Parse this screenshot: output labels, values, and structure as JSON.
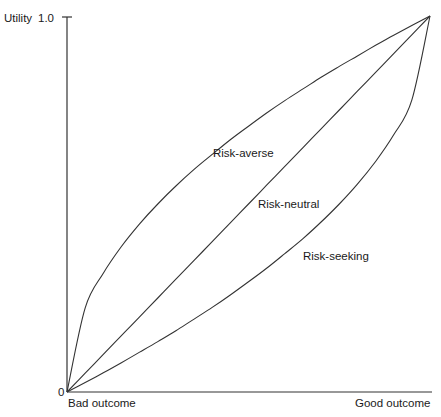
{
  "chart_data": {
    "type": "line",
    "title": "",
    "xlabel": "",
    "ylabel": "Utility",
    "xlim": [
      0,
      1
    ],
    "ylim": [
      0,
      1
    ],
    "x_tick_labels": [
      "Bad outcome",
      "Good outcome"
    ],
    "y_tick_labels": [
      "0",
      "1.0"
    ],
    "grid": false,
    "legend": "none (inline curve labels)",
    "x": [
      0,
      0.05,
      0.1,
      0.15,
      0.2,
      0.25,
      0.3,
      0.35,
      0.4,
      0.45,
      0.5,
      0.55,
      0.6,
      0.65,
      0.7,
      0.75,
      0.8,
      0.85,
      0.9,
      0.95,
      1.0
    ],
    "series": [
      {
        "name": "Risk-averse",
        "values": [
          0,
          0.224,
          0.316,
          0.387,
          0.447,
          0.5,
          0.548,
          0.592,
          0.632,
          0.671,
          0.707,
          0.742,
          0.775,
          0.806,
          0.837,
          0.866,
          0.894,
          0.922,
          0.949,
          0.975,
          1.0
        ]
      },
      {
        "name": "Risk-neutral",
        "values": [
          0,
          0.05,
          0.1,
          0.15,
          0.2,
          0.25,
          0.3,
          0.35,
          0.4,
          0.45,
          0.5,
          0.55,
          0.6,
          0.65,
          0.7,
          0.75,
          0.8,
          0.85,
          0.9,
          0.95,
          1.0
        ]
      },
      {
        "name": "Risk-seeking",
        "values": [
          0,
          0.025,
          0.051,
          0.078,
          0.106,
          0.134,
          0.163,
          0.194,
          0.225,
          0.258,
          0.293,
          0.329,
          0.368,
          0.408,
          0.452,
          0.5,
          0.553,
          0.613,
          0.684,
          0.776,
          1.0
        ]
      }
    ],
    "annotations": [
      {
        "text": "Risk-averse",
        "series": "Risk-averse"
      },
      {
        "text": "Risk-neutral",
        "series": "Risk-neutral"
      },
      {
        "text": "Risk-seeking",
        "series": "Risk-seeking"
      }
    ]
  }
}
